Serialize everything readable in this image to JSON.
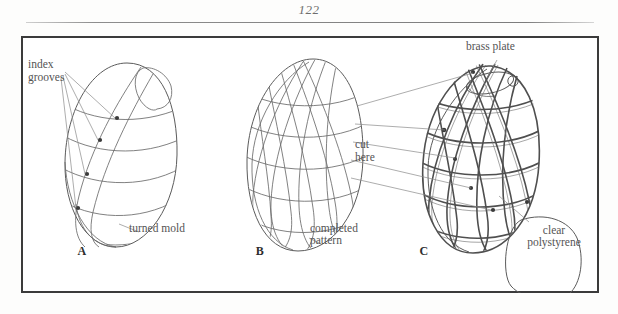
{
  "page": {
    "folio": "122",
    "background_color": "#fdfdfc",
    "frame_color": "#3b3b3b",
    "ink_color": "#545454"
  },
  "figure": {
    "panels": [
      {
        "key": "A",
        "letter": "A",
        "labels": [
          {
            "name": "index-grooves",
            "lines": [
              "index",
              "grooves"
            ]
          },
          {
            "name": "turned-mold",
            "lines": [
              "turned mold"
            ]
          }
        ],
        "description": "turned ovoid mold with index grooves"
      },
      {
        "key": "B",
        "letter": "B",
        "labels": [
          {
            "name": "completed-pattern",
            "lines": [
              "completed",
              "pattern"
            ]
          }
        ],
        "description": "completed woven pattern over ovoid"
      },
      {
        "key": "C",
        "letter": "C",
        "labels": [
          {
            "name": "brass-plate",
            "lines": [
              "brass plate"
            ]
          },
          {
            "name": "cut-here",
            "lines": [
              "cut",
              "here"
            ]
          },
          {
            "name": "clear-polystyrene",
            "lines": [
              "clear",
              "polystyrene"
            ]
          }
        ],
        "description": "wire cage with brass plate and polystyrene blank"
      }
    ],
    "label_text": {
      "index": "index",
      "grooves": "grooves",
      "turned_mold": "turned mold",
      "completed": "completed",
      "pattern": "pattern",
      "brass_plate": "brass plate",
      "cut": "cut",
      "here": "here",
      "clear": "clear",
      "polystyrene": "polystyrene",
      "letter_a": "A",
      "letter_b": "B",
      "letter_c": "C"
    }
  }
}
